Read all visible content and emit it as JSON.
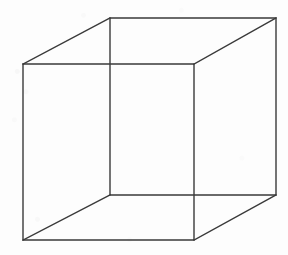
{
  "figure": {
    "type": "line-drawing",
    "caption": "",
    "canvas": {
      "width": 288,
      "height": 255,
      "background_color": "#fdfdfd"
    },
    "style": {
      "stroke_color": "#3a3a3a",
      "stroke_width": 1.4,
      "fill": "none",
      "line_join": "miter"
    },
    "vertices": {
      "front_top_left": [
        23,
        64
      ],
      "front_top_right": [
        194,
        64
      ],
      "front_bottom_right": [
        194,
        240
      ],
      "front_bottom_left": [
        23,
        240
      ],
      "back_top_left": [
        110,
        18
      ],
      "back_top_right": [
        276,
        18
      ],
      "back_bottom_right": [
        276,
        195
      ],
      "back_bottom_left": [
        110,
        195
      ]
    },
    "edges": [
      {
        "name": "front-top-edge",
        "from": "front_top_left",
        "to": "front_top_right"
      },
      {
        "name": "front-right-edge",
        "from": "front_top_right",
        "to": "front_bottom_right"
      },
      {
        "name": "front-bottom-edge",
        "from": "front_bottom_right",
        "to": "front_bottom_left"
      },
      {
        "name": "front-left-edge",
        "from": "front_bottom_left",
        "to": "front_top_left"
      },
      {
        "name": "back-top-edge",
        "from": "back_top_left",
        "to": "back_top_right"
      },
      {
        "name": "back-right-edge",
        "from": "back_top_right",
        "to": "back_bottom_right"
      },
      {
        "name": "back-bottom-edge",
        "from": "back_bottom_right",
        "to": "back_bottom_left"
      },
      {
        "name": "back-left-edge",
        "from": "back_bottom_left",
        "to": "back_top_left"
      },
      {
        "name": "connector-top-left",
        "from": "front_top_left",
        "to": "back_top_left"
      },
      {
        "name": "connector-top-right",
        "from": "front_top_right",
        "to": "back_top_right"
      },
      {
        "name": "connector-bottom-right",
        "from": "front_bottom_right",
        "to": "back_bottom_right"
      },
      {
        "name": "connector-bottom-left",
        "from": "front_bottom_left",
        "to": "back_bottom_left"
      }
    ],
    "paths": {
      "front_face": "M 23 64 L 194 64 L 194 240 L 23 240 Z",
      "back_face": "M 110 18 L 276 18 L 276 195 L 110 195 Z",
      "connector_top_left": "M 23 64 L 110 18",
      "connector_top_right": "M 194 64 L 276 18",
      "connector_bottom_right": "M 194 240 L 276 195",
      "connector_bottom_left": "M 23 240 L 110 195"
    }
  }
}
